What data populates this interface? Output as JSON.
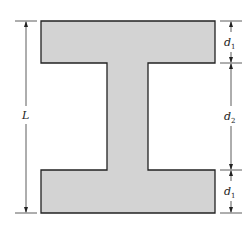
{
  "diagram": {
    "type": "I-beam cross-section",
    "colors": {
      "fill": "#d3d3d3",
      "stroke": "#222222",
      "dim_line": "#333333"
    },
    "labels": {
      "overall_height": "L",
      "top_flange": {
        "base": "d",
        "sub": "1"
      },
      "web": {
        "base": "d",
        "sub": "2"
      },
      "bottom_flange": {
        "base": "d",
        "sub": "1"
      }
    }
  }
}
